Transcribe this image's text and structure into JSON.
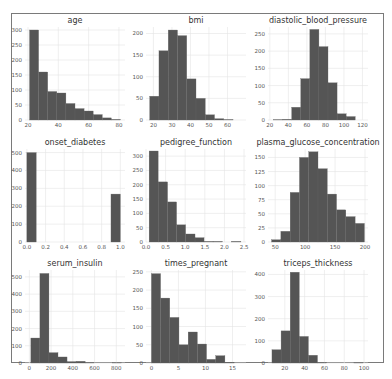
{
  "chart_data": [
    {
      "type": "bar",
      "title": "age",
      "edges": [
        21,
        27,
        33,
        39,
        45,
        51,
        57,
        63,
        69,
        75,
        81
      ],
      "values": [
        300,
        160,
        95,
        90,
        55,
        38,
        30,
        18,
        7,
        2
      ],
      "xticks": [
        20,
        40,
        60,
        80
      ],
      "yticks": [
        0,
        50,
        100,
        150,
        200,
        250,
        300
      ],
      "xlim": [
        18,
        84
      ],
      "ylim": [
        0,
        310
      ]
    },
    {
      "type": "bar",
      "title": "bmi",
      "edges": [
        18,
        23,
        28,
        33,
        38,
        43,
        48,
        53,
        58,
        63,
        68
      ],
      "values": [
        55,
        160,
        208,
        195,
        95,
        50,
        12,
        3,
        1,
        0
      ],
      "xticks": [
        20,
        30,
        40,
        50,
        60
      ],
      "yticks": [
        0,
        50,
        100,
        150,
        200
      ],
      "xlim": [
        16,
        70
      ],
      "ylim": [
        0,
        215
      ]
    },
    {
      "type": "bar",
      "title": "diastolic_blood_pressure",
      "edges": [
        24,
        33.8,
        43.6,
        53.4,
        63.2,
        73,
        82.8,
        92.6,
        102.4,
        112.2,
        122
      ],
      "values": [
        1,
        2,
        37,
        120,
        263,
        213,
        108,
        18,
        10,
        0
      ],
      "xticks": [
        20,
        40,
        60,
        80,
        100,
        120
      ],
      "yticks": [
        0,
        50,
        100,
        150,
        200,
        250
      ],
      "xlim": [
        18,
        126
      ],
      "ylim": [
        0,
        270
      ]
    },
    {
      "type": "bar",
      "title": "onset_diabetes",
      "edges": [
        0,
        0.1,
        0.2,
        0.3,
        0.4,
        0.5,
        0.6,
        0.7,
        0.8,
        0.9,
        1.0
      ],
      "values": [
        500,
        0,
        0,
        0,
        0,
        0,
        0,
        0,
        0,
        268
      ],
      "xticks": [
        "0.0",
        "0.2",
        "0.4",
        "0.6",
        "0.8",
        "1.0"
      ],
      "yticks": [
        0,
        100,
        200,
        300,
        400,
        500
      ],
      "xlim": [
        -0.02,
        1.05
      ],
      "ylim": [
        0,
        520
      ]
    },
    {
      "type": "bar",
      "title": "pedigree_function",
      "edges": [
        0.08,
        0.31,
        0.55,
        0.78,
        1.01,
        1.25,
        1.48,
        1.71,
        1.95,
        2.18,
        2.42
      ],
      "values": [
        318,
        210,
        140,
        60,
        28,
        15,
        2,
        2,
        0,
        2
      ],
      "xticks": [
        "0.0",
        "0.5",
        "1.0",
        "1.5",
        "2.0",
        "2.5"
      ],
      "yticks": [
        0,
        50,
        100,
        150,
        200,
        250,
        300
      ],
      "xlim": [
        0,
        2.55
      ],
      "ylim": [
        0,
        325
      ]
    },
    {
      "type": "bar",
      "title": "plasma_glucose_concentration",
      "edges": [
        44,
        59.5,
        75,
        90.5,
        106,
        121.5,
        137,
        152.5,
        168,
        183.5,
        199
      ],
      "values": [
        4,
        19,
        88,
        150,
        160,
        130,
        85,
        57,
        45,
        33
      ],
      "xticks": [
        50,
        100,
        150,
        200
      ],
      "yticks": [
        0,
        25,
        50,
        75,
        100,
        125,
        150
      ],
      "xlim": [
        38,
        205
      ],
      "ylim": [
        0,
        165
      ]
    },
    {
      "type": "bar",
      "title": "serum_insulin",
      "edges": [
        14,
        97.2,
        180.4,
        263.6,
        346.8,
        430,
        513.2,
        596.4,
        679.6,
        762.8,
        846
      ],
      "values": [
        145,
        520,
        60,
        35,
        8,
        10,
        2,
        0,
        0,
        1
      ],
      "xticks": [
        0,
        200,
        400,
        600,
        800
      ],
      "yticks": [
        0,
        100,
        200,
        300,
        400,
        500
      ],
      "xlim": [
        -40,
        880
      ],
      "ylim": [
        0,
        540
      ]
    },
    {
      "type": "bar",
      "title": "times_pregnant",
      "edges": [
        0,
        1.7,
        3.4,
        5.1,
        6.8,
        8.5,
        10.2,
        11.9,
        13.6,
        15.3,
        17
      ],
      "values": [
        245,
        178,
        125,
        50,
        85,
        52,
        10,
        20,
        2,
        0
      ],
      "xticks": [
        0,
        5,
        10,
        15
      ],
      "yticks": [
        0,
        50,
        100,
        150,
        200,
        250
      ],
      "xlim": [
        -1,
        17.5
      ],
      "ylim": [
        0,
        255
      ]
    },
    {
      "type": "bar",
      "title": "triceps_thickness",
      "edges": [
        7,
        16.2,
        25.4,
        34.6,
        43.8,
        53,
        62.2,
        71.4,
        80.6,
        89.8,
        99
      ],
      "values": [
        60,
        145,
        410,
        120,
        35,
        2,
        0,
        0,
        0,
        1
      ],
      "xticks": [
        20,
        40,
        60,
        80,
        100
      ],
      "yticks": [
        0,
        100,
        200,
        300,
        400
      ],
      "xlim": [
        3,
        104
      ],
      "ylim": [
        0,
        420
      ]
    }
  ],
  "colors": {
    "bar": "#555555",
    "frame": "#7a7a7a",
    "grid": "#e4e4e4"
  }
}
